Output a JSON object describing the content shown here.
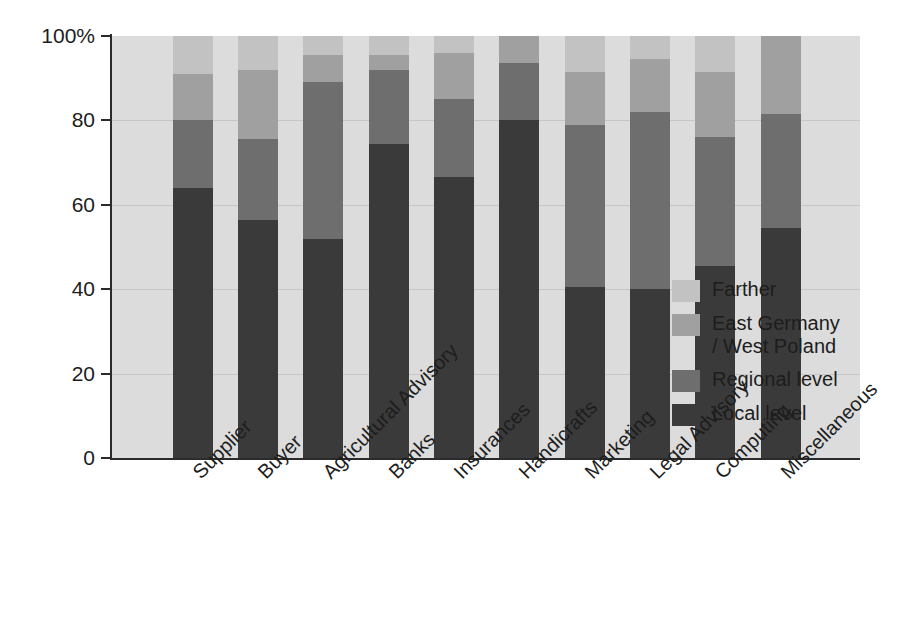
{
  "chart_data": {
    "type": "bar",
    "subtype": "stacked-100-percent",
    "title": "",
    "xlabel": "",
    "ylabel": "",
    "ylim": [
      0,
      100
    ],
    "ytick_labels": [
      "100%",
      "80",
      "60",
      "40",
      "20",
      "0"
    ],
    "ytick_values": [
      100,
      80,
      60,
      40,
      20,
      0
    ],
    "grid": true,
    "legend_position": "right-inside",
    "categories": [
      "Supplier",
      "Buyer",
      "Agricultural Advisory",
      "Banks",
      "Insurances",
      "Handicrafts",
      "Marketing",
      "Legal Advisory",
      "Computing",
      "Miscellaneous"
    ],
    "series": [
      {
        "name": "Local level",
        "color": "#3a3a3a",
        "values": [
          64.0,
          56.5,
          52.0,
          74.5,
          66.5,
          80.0,
          40.5,
          40.0,
          45.5,
          54.5
        ]
      },
      {
        "name": "Regional level",
        "color": "#6e6e6e",
        "values": [
          16.0,
          19.0,
          37.0,
          17.5,
          18.5,
          13.5,
          38.5,
          42.0,
          30.5,
          27.0
        ]
      },
      {
        "name": "East Germany\n/ West Poland",
        "color": "#a0a0a0",
        "values": [
          11.0,
          16.5,
          6.5,
          3.5,
          11.0,
          6.5,
          12.5,
          12.5,
          15.5,
          18.5
        ]
      },
      {
        "name": "Farther",
        "color": "#c2c2c2",
        "values": [
          9.0,
          8.0,
          4.5,
          4.5,
          4.0,
          0.0,
          8.5,
          5.5,
          8.5,
          0.0
        ]
      }
    ],
    "cumulative_tops": [
      {
        "category": "Supplier",
        "local": 64.0,
        "regional": 80.0,
        "east_west": 91.0,
        "farther": 100
      },
      {
        "category": "Buyer",
        "local": 56.5,
        "regional": 75.5,
        "east_west": 92.0,
        "farther": 100
      },
      {
        "category": "Agricultural Advisory",
        "local": 52.0,
        "regional": 89.0,
        "east_west": 95.5,
        "farther": 100
      },
      {
        "category": "Banks",
        "local": 74.5,
        "regional": 92.0,
        "east_west": 95.5,
        "farther": 100
      },
      {
        "category": "Insurances",
        "local": 66.5,
        "regional": 85.0,
        "east_west": 96.0,
        "farther": 100
      },
      {
        "category": "Handicrafts",
        "local": 80.0,
        "regional": 93.5,
        "east_west": 100.0,
        "farther": 100
      },
      {
        "category": "Marketing",
        "local": 40.5,
        "regional": 79.0,
        "east_west": 91.5,
        "farther": 100
      },
      {
        "category": "Legal Advisory",
        "local": 40.0,
        "regional": 82.0,
        "east_west": 94.5,
        "farther": 100
      },
      {
        "category": "Computing",
        "local": 45.5,
        "regional": 76.0,
        "east_west": 91.0,
        "farther": 100
      },
      {
        "category": "Miscellaneous",
        "local": 54.5,
        "regional": 81.5,
        "east_west": 100.0,
        "farther": 100
      }
    ],
    "legend_entries": [
      {
        "label": "Farther",
        "color": "#c2c2c2"
      },
      {
        "label": "East Germany\n/ West Poland",
        "color": "#a0a0a0"
      },
      {
        "label": "Regional level",
        "color": "#6e6e6e"
      },
      {
        "label": "Local level",
        "color": "#3a3a3a"
      }
    ],
    "plot_background": "#dcdcdc",
    "axis_color": "#2b2b2b",
    "gridline_color": "#c6c6c6"
  }
}
